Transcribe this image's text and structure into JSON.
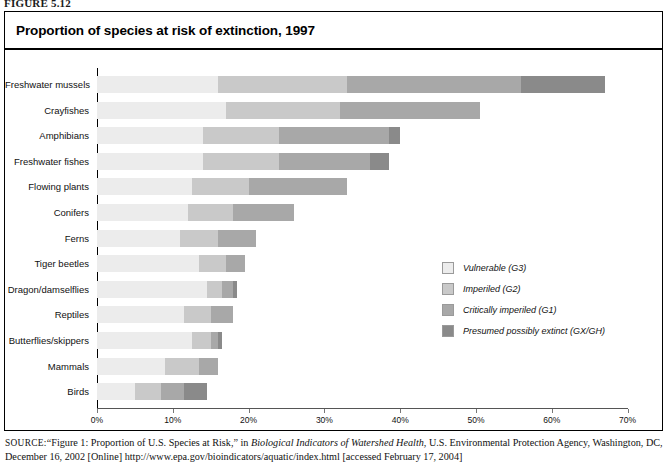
{
  "figure": {
    "caption": "FIGURE 5.12"
  },
  "panel": {
    "title": "Proportion of species at risk of extinction, 1997"
  },
  "source": {
    "label": "SOURCE:",
    "text_part1": "“Figure 1: Proportion of U.S. Species at Risk,” in ",
    "italic_title": "Biological Indicators of Watershed Health",
    "text_part2": ", U.S. Environmental Protection Agency, Washington, DC, December 16, 2002 [Online] http://www.epa.gov/bioindicators/aquatic/index.html [accessed February 17, 2004]"
  },
  "legend": {
    "items": [
      {
        "label": "Vulnerable (G3)",
        "color": "#ececec"
      },
      {
        "label": "Imperiled (G2)",
        "color": "#c9c9c9"
      },
      {
        "label": "Critically imperiled (G1)",
        "color": "#a8a8a8"
      },
      {
        "label": "Presumed possibly extinct (GX/GH)",
        "color": "#8a8a8a"
      }
    ]
  },
  "chart_data": {
    "type": "bar",
    "orientation": "horizontal",
    "stacked": true,
    "title": "Proportion of species at risk of extinction, 1997",
    "xlabel": "",
    "ylabel": "",
    "xlim": [
      0,
      70
    ],
    "xticks": [
      0,
      10,
      20,
      30,
      40,
      50,
      60,
      70
    ],
    "xtick_labels": [
      "0%",
      "10%",
      "20%",
      "30%",
      "40%",
      "50%",
      "60%",
      "70%"
    ],
    "grid": false,
    "legend_position": "center-right",
    "categories": [
      "Freshwater mussels",
      "Crayfishes",
      "Amphibians",
      "Freshwater fishes",
      "Flowing plants",
      "Conifers",
      "Ferns",
      "Tiger beetles",
      "Dragon/damselflies",
      "Reptiles",
      "Butterflies/skippers",
      "Mammals",
      "Birds"
    ],
    "series": [
      {
        "name": "Vulnerable (G3)",
        "color": "#ececec",
        "values": [
          16.0,
          17.0,
          14.0,
          14.0,
          12.5,
          12.0,
          11.0,
          13.5,
          14.5,
          11.5,
          12.5,
          9.0,
          5.0
        ]
      },
      {
        "name": "Imperiled (G2)",
        "color": "#c9c9c9",
        "values": [
          17.0,
          15.0,
          10.0,
          10.0,
          7.5,
          6.0,
          5.0,
          3.5,
          2.0,
          3.5,
          2.5,
          4.5,
          3.5
        ]
      },
      {
        "name": "Critically imperiled (G1)",
        "color": "#a8a8a8",
        "values": [
          23.0,
          18.5,
          14.5,
          12.0,
          13.0,
          8.0,
          5.0,
          2.5,
          1.5,
          3.0,
          1.0,
          2.5,
          3.0
        ]
      },
      {
        "name": "Presumed possibly extinct (GX/GH)",
        "color": "#8a8a8a",
        "values": [
          11.0,
          0.0,
          1.5,
          2.5,
          0.0,
          0.0,
          0.0,
          0.0,
          0.5,
          0.0,
          0.5,
          0.0,
          3.0
        ]
      }
    ],
    "totals": [
      67.0,
      50.5,
      40.0,
      38.5,
      33.0,
      26.0,
      21.0,
      19.5,
      18.5,
      18.0,
      16.5,
      16.0,
      14.5
    ]
  }
}
